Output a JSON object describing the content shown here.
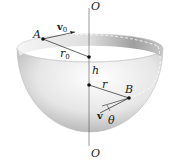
{
  "diagram": {
    "type": "hemispherical-bowl-particle-motion",
    "labels": {
      "axis_top": "O",
      "axis_bottom": "O",
      "point_a": "A",
      "point_b": "B",
      "initial_velocity": "v",
      "initial_velocity_subscript": "0",
      "initial_radius": "r",
      "initial_radius_subscript": "0",
      "height": "h",
      "radius": "r",
      "velocity": "v",
      "angle": "θ"
    },
    "colors": {
      "bowl_light": "#f2f2f2",
      "bowl_dark": "#9a9a9a",
      "line": "#222222",
      "axis": "#555555"
    }
  }
}
